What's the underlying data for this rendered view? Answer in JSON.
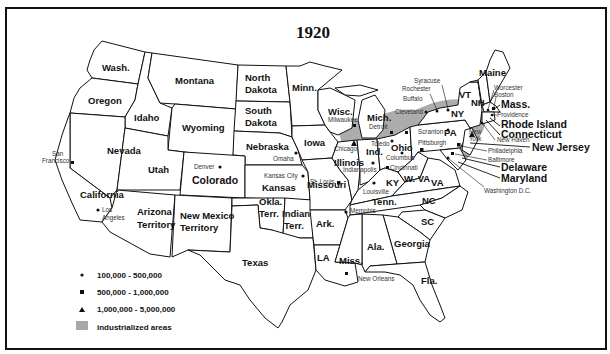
{
  "title": "1920",
  "colors": {
    "border": "#111111",
    "industrialized": "#a8a8a8",
    "background": "#ffffff"
  },
  "states": {
    "wash": "Wash.",
    "oregon": "Oregon",
    "idaho": "Idaho",
    "montana": "Montana",
    "wyoming": "Wyoming",
    "north_dakota_1": "North",
    "north_dakota_2": "Dakota",
    "south_dakota_1": "South",
    "south_dakota_2": "Dakota",
    "minn": "Minn.",
    "wisc": "Wisc.",
    "mich": "Mich.",
    "iowa": "Iowa",
    "nebraska": "Nebraska",
    "nevada": "Nevada",
    "utah": "Utah",
    "colorado": "Colorado",
    "kansas": "Kansas",
    "california": "California",
    "arizona_1": "Arizona",
    "arizona_2": "Territory",
    "new_mexico_1": "New Mexico",
    "new_mexico_2": "Territory",
    "okla_1": "Okla.",
    "okla_2": "Terr.",
    "indian_1": "Indian",
    "indian_2": "Terr.",
    "texas": "Texas",
    "missouri": "Missouri",
    "illinois": "Illinois",
    "ind": "Ind.",
    "ohio": "Ohio",
    "ky": "KY",
    "wva": "W. VA",
    "va": "VA",
    "tenn": "Tenn.",
    "nc": "NC",
    "sc": "SC",
    "georgia": "Georgia",
    "ala": "Ala.",
    "miss": "Miss.",
    "la": "LA",
    "ark": "Ark.",
    "fla": "Fla.",
    "pa": "PA",
    "ny": "NY",
    "vt": "VT",
    "nh": "NH",
    "maine": "Maine",
    "mass": "Mass.",
    "rhode_island": "Rhode Island",
    "connecticut": "Connecticut",
    "new_jersey": "New Jersey",
    "delaware": "Delaware",
    "maryland": "Maryland"
  },
  "cities": {
    "san_francisco_1": "San",
    "san_francisco_2": "Francisco",
    "los_angeles_1": "Los",
    "los_angeles_2": "Angeles",
    "denver": "Denver",
    "omaha": "Omaha",
    "kansas_city": "Kansas City",
    "st_louis": "St. Louis",
    "chicago": "Chicago",
    "milwaukee": "Milwaukee",
    "detroit": "Detroit",
    "toledo": "Toledo",
    "cleveland": "Cleveland",
    "columbus": "Columbus",
    "indianapolis": "Indianapolis",
    "cincinnati": "Cincinnati",
    "louisville": "Louisville",
    "memphis": "Memphis",
    "new_orleans": "New Orleans",
    "buffalo": "Buffalo",
    "rochester": "Rochester",
    "syracuse": "Syracuse",
    "scranton": "Scranton",
    "pittsburgh": "Pittsburgh",
    "new_york_1": "New",
    "new_york_2": "York",
    "worcester": "Worcester",
    "boston": "Boston",
    "providence": "Providence",
    "new_haven": "New Haven",
    "philadelphia": "Philadelphia",
    "baltimore": "Baltimore",
    "washington_dc": "Washington D.C."
  },
  "legend": {
    "items": [
      {
        "symbol": "circle",
        "label": "100,000 - 500,000"
      },
      {
        "symbol": "square",
        "label": "500,000 - 1,000,000"
      },
      {
        "symbol": "triangle",
        "label": "1,000,000 - 5,000,000"
      },
      {
        "symbol": "gray-box",
        "label": "industrialized areas"
      }
    ]
  }
}
